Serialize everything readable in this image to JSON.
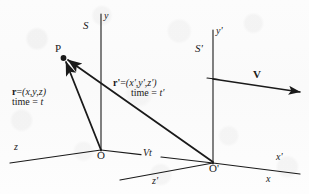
{
  "figure": {
    "ink_color": "#1a1a1a",
    "paper_color": "#fdfdfd"
  },
  "frames": {
    "rest": {
      "name": "S",
      "y_axis": "y",
      "x_axis": "x",
      "z_axis": "z",
      "origin": "O"
    },
    "moving": {
      "name": "S'",
      "y_axis": "y'",
      "x_axis": "x'",
      "z_axis": "z'",
      "origin": "O'"
    }
  },
  "point": {
    "label": "P"
  },
  "vectors": {
    "velocity": {
      "label": "V"
    },
    "separation": {
      "label": "Vt"
    },
    "r": {
      "symbol": "r",
      "equals": "=",
      "components": "(x,y,z)",
      "time_label": "time =",
      "time_value": "t"
    },
    "r_prime": {
      "symbol": "r'",
      "equals": "=",
      "components": "(x',y',z')",
      "time_label": "time =",
      "time_value": "t'"
    }
  }
}
